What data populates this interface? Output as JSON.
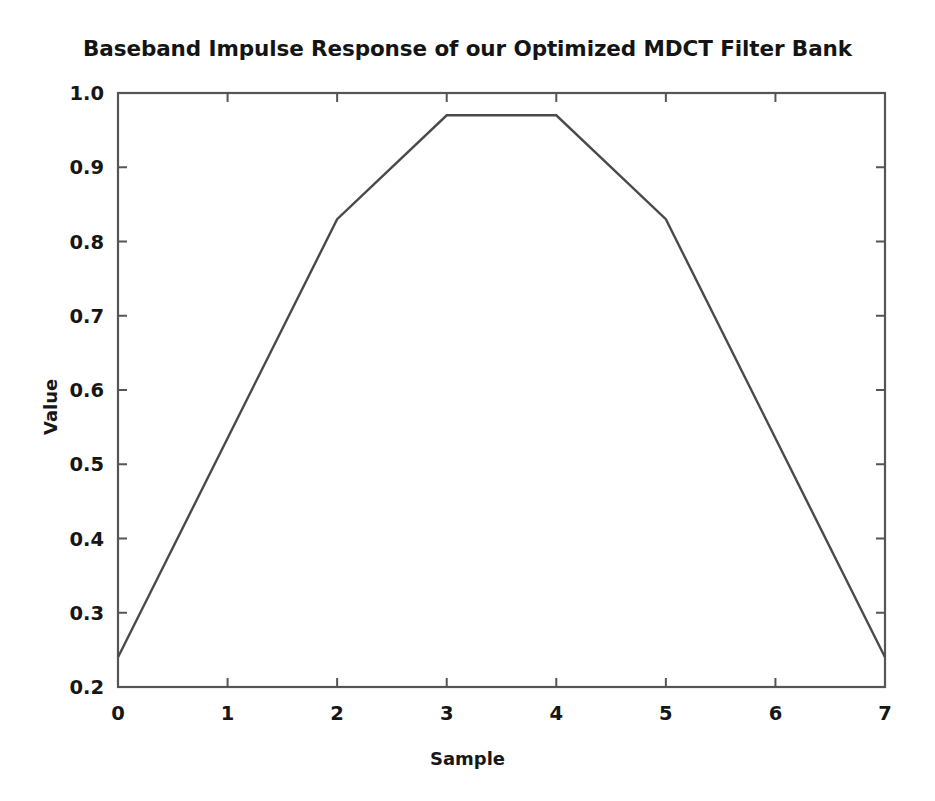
{
  "chart_data": {
    "type": "line",
    "title": "Baseband Impulse Response of our Optimized MDCT Filter Bank",
    "xlabel": "Sample",
    "ylabel": "Value",
    "x": [
      0,
      1,
      2,
      3,
      4,
      5,
      6,
      7
    ],
    "values": [
      0.24,
      0.535,
      0.83,
      0.97,
      0.97,
      0.83,
      0.535,
      0.24
    ],
    "series": [
      {
        "name": "Baseband impulse response",
        "values": [
          0.24,
          0.535,
          0.83,
          0.97,
          0.97,
          0.83,
          0.535,
          0.24
        ]
      }
    ],
    "xlim": [
      0,
      7
    ],
    "ylim": [
      0.2,
      1.0
    ],
    "xticks": [
      0,
      1,
      2,
      3,
      4,
      5,
      6,
      7
    ],
    "xtick_labels": [
      "0",
      "1",
      "2",
      "3",
      "4",
      "5",
      "6",
      "7"
    ],
    "yticks": [
      0.2,
      0.3,
      0.4,
      0.5,
      0.6,
      0.7,
      0.8,
      0.9,
      1.0
    ],
    "ytick_labels": [
      "0.2",
      "0.3",
      "0.4",
      "0.5",
      "0.6",
      "0.7",
      "0.8",
      "0.9",
      "1.0"
    ],
    "grid": false,
    "legend": false,
    "legend_position": "none",
    "line_color": "#4a4a4a",
    "frame_color": "#555555",
    "background_color": "#ffffff"
  }
}
